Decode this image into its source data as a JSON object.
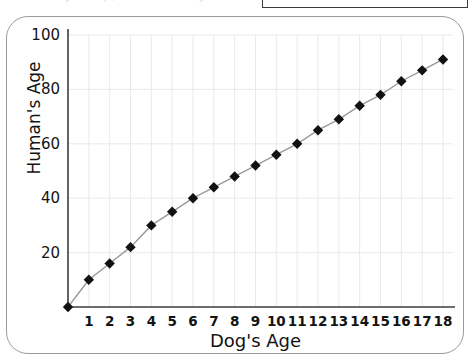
{
  "top_strip": {
    "caption": "dogs' birthdays, but how are humans' age?",
    "rule_name": "top-black-rule"
  },
  "chart_data": {
    "type": "line",
    "title": "",
    "xlabel": "Dog's Age",
    "ylabel": "Human's Age",
    "x": [
      0,
      1,
      2,
      3,
      4,
      5,
      6,
      7,
      8,
      9,
      10,
      11,
      12,
      13,
      14,
      15,
      16,
      17,
      18
    ],
    "values": [
      0,
      10,
      16,
      22,
      30,
      35,
      40,
      44,
      48,
      52,
      56,
      60,
      65,
      69,
      74,
      78,
      83,
      87,
      91
    ],
    "xlim": [
      0,
      18
    ],
    "ylim": [
      0,
      100
    ],
    "xticks": [
      1,
      2,
      3,
      4,
      5,
      6,
      7,
      8,
      9,
      10,
      11,
      12,
      13,
      14,
      15,
      16,
      17,
      18
    ],
    "yticks": [
      20,
      40,
      60,
      80,
      100
    ],
    "grid": true,
    "legend": "none",
    "marker": "filled-diamond",
    "marker_color": "#111111",
    "line_color": "#9a9a9a",
    "grid_color": "#e8e8ef",
    "axis_color": "#3d3d3d",
    "frame_color": "#9b9b9b"
  }
}
